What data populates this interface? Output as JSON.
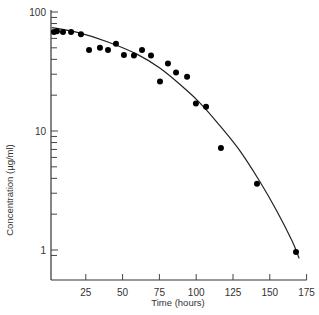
{
  "chart_data": {
    "type": "scatter",
    "title": "",
    "xlabel": "Time (hours)",
    "ylabel": "Concentration (µg/ml)",
    "xlim": [
      0,
      175
    ],
    "ylim": [
      0.8,
      100
    ],
    "yscale": "log",
    "grid": false,
    "legend": null,
    "x_ticks": [
      25,
      50,
      75,
      100,
      125,
      150,
      175
    ],
    "x_tick_labels": [
      "25",
      "50",
      "75",
      "100",
      "125",
      "150",
      "175"
    ],
    "y_ticks": [
      1,
      10,
      100
    ],
    "y_tick_labels": [
      "1",
      "10",
      "100"
    ],
    "series": [
      {
        "name": "observed",
        "type": "scatter",
        "marker": "filled-circle",
        "color": "#000000",
        "points": [
          {
            "x": 3.4,
            "y": 68
          },
          {
            "x": 5.4,
            "y": 69
          },
          {
            "x": 9.5,
            "y": 68
          },
          {
            "x": 15,
            "y": 68
          },
          {
            "x": 21.7,
            "y": 65
          },
          {
            "x": 27.2,
            "y": 48
          },
          {
            "x": 34.6,
            "y": 50
          },
          {
            "x": 40.1,
            "y": 48
          },
          {
            "x": 45.5,
            "y": 54
          },
          {
            "x": 50.9,
            "y": 43.5
          },
          {
            "x": 57.7,
            "y": 43
          },
          {
            "x": 63.2,
            "y": 48
          },
          {
            "x": 69.3,
            "y": 43
          },
          {
            "x": 75.4,
            "y": 26
          },
          {
            "x": 80.8,
            "y": 37
          },
          {
            "x": 86.3,
            "y": 31
          },
          {
            "x": 93.8,
            "y": 28.5
          },
          {
            "x": 99.8,
            "y": 17
          },
          {
            "x": 106.7,
            "y": 16
          },
          {
            "x": 116.8,
            "y": 7.2
          },
          {
            "x": 141.3,
            "y": 3.6
          },
          {
            "x": 167.8,
            "y": 0.96
          }
        ]
      },
      {
        "name": "fitted curve",
        "type": "line",
        "color": "#222222",
        "points": [
          {
            "x": 2,
            "y": 74
          },
          {
            "x": 20,
            "y": 67
          },
          {
            "x": 40,
            "y": 56
          },
          {
            "x": 60,
            "y": 44
          },
          {
            "x": 75,
            "y": 34
          },
          {
            "x": 90,
            "y": 24
          },
          {
            "x": 102,
            "y": 17.5
          },
          {
            "x": 115,
            "y": 11.5
          },
          {
            "x": 129,
            "y": 7
          },
          {
            "x": 143,
            "y": 3.8
          },
          {
            "x": 155,
            "y": 2.1
          },
          {
            "x": 165,
            "y": 1.2
          },
          {
            "x": 170,
            "y": 0.85
          }
        ]
      }
    ]
  }
}
